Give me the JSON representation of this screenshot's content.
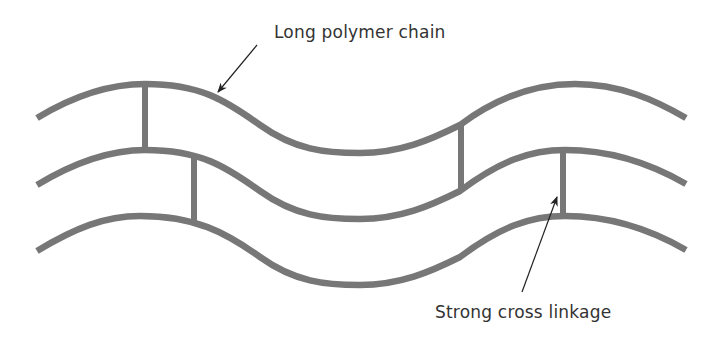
{
  "diagram": {
    "labels": {
      "polymer_chain": "Long polymer chain",
      "cross_linkage": "Strong cross linkage"
    },
    "colors": {
      "chain": "#777777",
      "arrow": "#222222",
      "text": "#333333",
      "background": "#ffffff"
    },
    "chains": 3,
    "cross_links": 4
  }
}
